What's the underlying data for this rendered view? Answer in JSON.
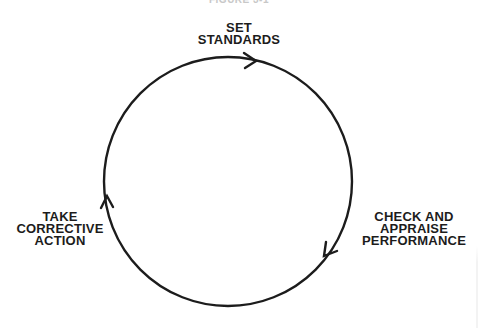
{
  "figure": {
    "caption": "FIGURE 3-1",
    "type": "cycle",
    "direction": "clockwise",
    "line_color": "#1c1c1c",
    "background": "#ffffff"
  },
  "nodes": [
    {
      "id": "set-standards",
      "position": "top",
      "lines": [
        "SET",
        "STANDARDS"
      ]
    },
    {
      "id": "check-and-appraise-performance",
      "position": "lower-right",
      "lines": [
        "CHECK AND",
        "APPRAISE",
        "PERFORMANCE"
      ]
    },
    {
      "id": "take-corrective-action",
      "position": "lower-left",
      "lines": [
        "TAKE",
        "CORRECTIVE",
        "ACTION"
      ]
    }
  ],
  "edges": [
    {
      "from": "set-standards",
      "to": "check-and-appraise-performance",
      "arrow": "arrowhead-right-top"
    },
    {
      "from": "check-and-appraise-performance",
      "to": "take-corrective-action",
      "arrow": "arrowhead-down-left"
    },
    {
      "from": "take-corrective-action",
      "to": "set-standards",
      "arrow": "arrowhead-up-left"
    }
  ]
}
